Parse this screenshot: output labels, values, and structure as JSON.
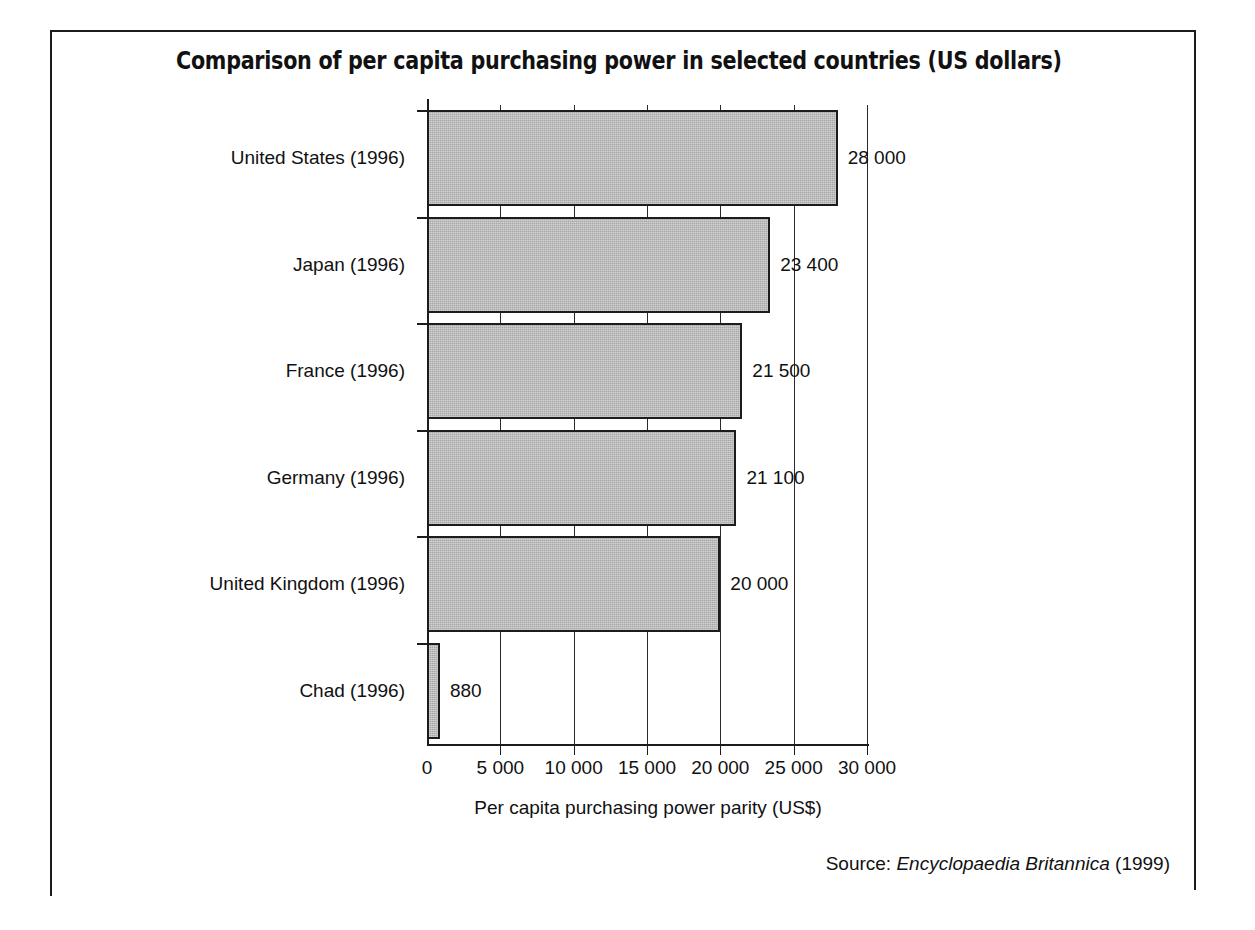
{
  "figure": {
    "title": "Comparison of per capita purchasing power in selected countries (US dollars)",
    "source_prefix": "Source:",
    "source_work": "Encyclopaedia Britannica",
    "source_year": "(1999)"
  },
  "chart_data": {
    "type": "bar",
    "orientation": "horizontal",
    "title": "Comparison of per capita purchasing power in selected countries (US dollars)",
    "xlabel": "Per capita purchasing power parity (US$)",
    "ylabel": "",
    "xlim": [
      0,
      30000
    ],
    "grid": true,
    "legend": "none",
    "categories": [
      "United States (1996)",
      "Japan (1996)",
      "France (1996)",
      "Germany (1996)",
      "United Kingdom (1996)",
      "Chad (1996)"
    ],
    "values": [
      28000,
      23400,
      21500,
      21100,
      20000,
      880
    ],
    "value_labels": [
      "28 000",
      "23 400",
      "21 500",
      "21 100",
      "20 000",
      "880"
    ],
    "xticks": [
      0,
      5000,
      10000,
      15000,
      20000,
      25000,
      30000
    ],
    "xtick_labels": [
      "0",
      "5 000",
      "10 000",
      "15 000",
      "20 000",
      "25 000",
      "30 000"
    ],
    "bar_fill": "#a9a9a9",
    "bar_edge": "#1c1c1c"
  }
}
